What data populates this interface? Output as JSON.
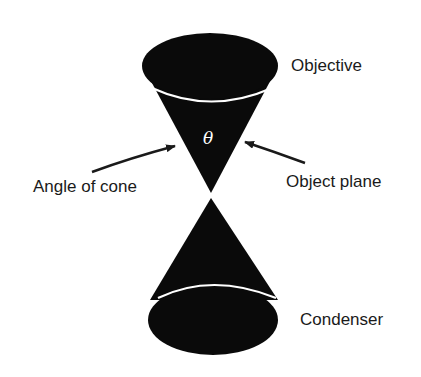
{
  "diagram": {
    "type": "cone-of-illumination",
    "labels": {
      "objective": "Objective",
      "condenser": "Condenser",
      "angle_of_cone": "Angle of cone",
      "object_plane": "Object plane",
      "theta": "θ"
    },
    "colors": {
      "cone_fill": "#0a0a0a",
      "rim_line": "#ffffff",
      "text": "#1a1a1a",
      "background": "#ffffff"
    }
  }
}
